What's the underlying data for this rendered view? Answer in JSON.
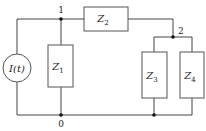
{
  "diagram": {
    "type": "circuit",
    "source": {
      "label": "I(t)",
      "kind": "current-source"
    },
    "components": [
      {
        "id": "Z1",
        "letter": "Z",
        "sub": "1",
        "between": [
          "1",
          "0"
        ]
      },
      {
        "id": "Z2",
        "letter": "Z",
        "sub": "2",
        "between": [
          "1",
          "2"
        ]
      },
      {
        "id": "Z3",
        "letter": "Z",
        "sub": "3",
        "between": [
          "2",
          "0"
        ]
      },
      {
        "id": "Z4",
        "letter": "Z",
        "sub": "4",
        "between": [
          "2",
          "0"
        ]
      }
    ],
    "nodes": {
      "n1": "1",
      "n2": "2",
      "n0": "0"
    },
    "colors": {
      "wire": "#444444",
      "background": "#ffffff"
    }
  }
}
